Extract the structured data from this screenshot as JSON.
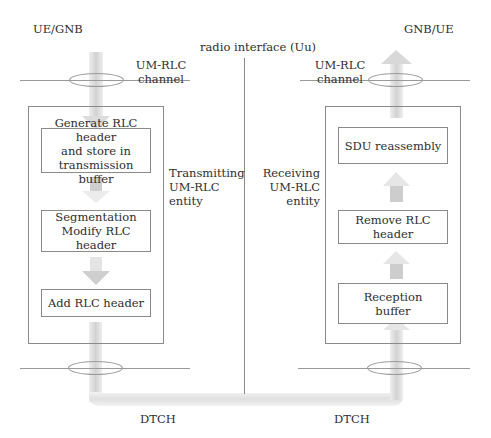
{
  "header": {
    "left_node": "UE/GNB",
    "right_node": "GNB/UE",
    "interface": "radio interface (Uu)"
  },
  "left": {
    "channel_label_line1": "UM-RLC",
    "channel_label_line2": "channel",
    "entity_label_line1": "Transmitting",
    "entity_label_line2": "UM-RLC",
    "entity_label_line3": "entity",
    "steps": [
      {
        "line1": "Generate RLC header",
        "line2": "and store in",
        "line3": "transmission buffer"
      },
      {
        "line1": "Segmentation",
        "line2": "Modify RLC header"
      },
      {
        "line1": "Add RLC header"
      }
    ],
    "transport_label": "DTCH"
  },
  "right": {
    "channel_label_line1": "UM-RLC",
    "channel_label_line2": "channel",
    "entity_label_line1": "Receiving",
    "entity_label_line2": "UM-RLC",
    "entity_label_line3": "entity",
    "steps": [
      {
        "line1": "SDU reassembly"
      },
      {
        "line1": "Remove RLC header"
      },
      {
        "line1": "Reception",
        "line2": "buffer"
      }
    ],
    "transport_label": "DTCH"
  },
  "colors": {
    "line": "#9a9a9a",
    "arrow_light": "#ececec",
    "arrow_dark": "#c4c4c4",
    "text": "#2e2e2e"
  }
}
